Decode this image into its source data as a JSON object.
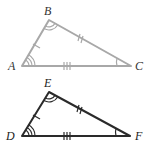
{
  "diagram": {
    "triangles": [
      {
        "name": "ABC",
        "color": "#a8a8a8",
        "vertices": {
          "A": "A",
          "B": "B",
          "C": "C"
        },
        "marks": {
          "AB": "single tick",
          "BC": "double tick",
          "AC": "triple tick",
          "A": "triple arc",
          "B": "double arc",
          "C": "single arc"
        }
      },
      {
        "name": "DEF",
        "color": "#2a2a2a",
        "vertices": {
          "D": "D",
          "E": "E",
          "F": "F"
        },
        "marks": {
          "DE": "single tick",
          "EF": "double tick",
          "DF": "triple tick",
          "D": "triple arc",
          "E": "double arc",
          "F": "single arc"
        }
      }
    ]
  }
}
